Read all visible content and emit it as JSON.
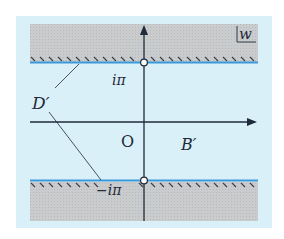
{
  "figure": {
    "plane_label": "w",
    "region_labels": {
      "boundary": "D′",
      "interior": "B′"
    },
    "points": {
      "origin": "O",
      "upper": "iπ",
      "lower": "−iπ"
    },
    "colors": {
      "background": "#daf0f8",
      "excluded_region": "#c6c8ca",
      "boundary_line": "#3a9ad9",
      "axis": "#1f2a3a",
      "hatch": "#3a3f46"
    }
  }
}
